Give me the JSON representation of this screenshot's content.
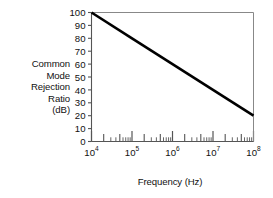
{
  "chart_data": {
    "type": "line",
    "title": "",
    "subtitle": "",
    "xlabel": "Frequency (Hz)",
    "ylabel": "Common Mode Rejection Ratio (dB)",
    "ylabel_lines": [
      "Common",
      "Mode",
      "Rejection",
      "Ratio",
      "(dB)"
    ],
    "xscale": "log",
    "yscale": "linear",
    "xlim": [
      10000,
      100000000
    ],
    "ylim": [
      0,
      100
    ],
    "grid": false,
    "legend": null,
    "legend_position": "none",
    "x_tick_labels": [
      "10⁴",
      "10⁵",
      "10⁶",
      "10⁷",
      "10⁸"
    ],
    "x_tick_bases": [
      "10",
      "10",
      "10",
      "10",
      "10"
    ],
    "x_tick_exponents": [
      "4",
      "5",
      "6",
      "7",
      "8"
    ],
    "x_tick_values": [
      10000,
      100000,
      1000000,
      10000000,
      100000000
    ],
    "x_minor_multipliers": [
      2,
      3,
      4,
      5,
      6,
      7,
      8,
      9
    ],
    "x_minor_emphasized": [
      2,
      5
    ],
    "y_tick_labels": [
      "0",
      "10",
      "20",
      "30",
      "40",
      "50",
      "60",
      "70",
      "80",
      "90",
      "100"
    ],
    "y_tick_values": [
      0,
      10,
      20,
      30,
      40,
      50,
      60,
      70,
      80,
      90,
      100
    ],
    "series": [
      {
        "name": "CMRR rolloff",
        "slope_db_per_decade": -20,
        "x": [
          10000,
          100000,
          1000000,
          10000000,
          100000000
        ],
        "y": [
          100,
          80,
          60,
          40,
          20
        ]
      }
    ],
    "annotations": [],
    "colors": {
      "line": "#000000",
      "axis": "#555555",
      "frame": "#888888",
      "background": "#ffffff",
      "text": "#111111"
    }
  }
}
